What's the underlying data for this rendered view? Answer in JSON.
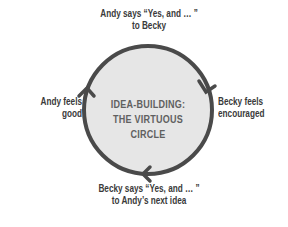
{
  "diagram": {
    "title_line1": "IDEA-BUILDING:",
    "title_line2": "THE VIRTUOUS CIRCLE",
    "nodes": [
      {
        "position": "top",
        "line1": "Andy says “Yes, and … ”",
        "line2": "to Becky"
      },
      {
        "position": "right",
        "line1": "Becky feels",
        "line2": "encouraged"
      },
      {
        "position": "bottom",
        "line1": "Becky says “Yes, and … ”",
        "line2": "to Andy’s next idea"
      },
      {
        "position": "left",
        "line1": "Andy feels",
        "line2": "good"
      }
    ],
    "colors": {
      "circle_fill": "#e6e6e6",
      "circle_stroke": "#4a4a4a",
      "label_text": "#3a3a3a",
      "title_text": "#606060"
    },
    "flow": "clockwise"
  }
}
